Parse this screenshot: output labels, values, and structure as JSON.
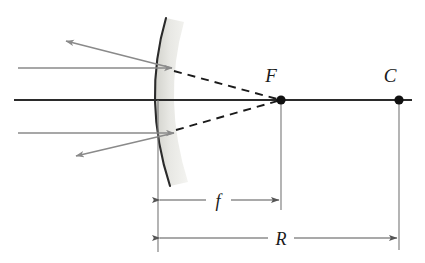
{
  "figure": {
    "type": "optics-ray-diagram",
    "background_color": "#ffffff"
  },
  "labels": {
    "focal_point": "F",
    "center_of_curvature": "C",
    "focal_length": "f",
    "radius_of_curvature": "R"
  },
  "colors": {
    "axis": "#2b2b2b",
    "ray": "#8a8a8a",
    "dashed_extension": "#1a1a1a",
    "mirror_outline": "#2b2b2b",
    "mirror_body": "#e4e4e0",
    "point_marker": "#111111",
    "dimension_line": "#555555",
    "tick_line": "#777777",
    "label_text": "#1a1a1a"
  },
  "geometry": {
    "mirror": {
      "vertex": [
        158,
        100
      ],
      "top": [
        166,
        18
      ],
      "bottom": [
        170,
        186
      ],
      "curvature": "convex-toward-left"
    },
    "principal_axis": {
      "start": [
        14,
        100
      ],
      "end": [
        412,
        100
      ]
    },
    "focal_point": [
      281,
      100
    ],
    "center_of_curvature": [
      399,
      100
    ],
    "incoming_rays": [
      {
        "name": "upper-incoming-ray",
        "from": [
          18,
          68
        ],
        "to": [
          172,
          68
        ]
      },
      {
        "name": "lower-incoming-ray",
        "from": [
          18,
          133
        ],
        "to": [
          174,
          133
        ]
      }
    ],
    "reflected_rays": [
      {
        "name": "upper-reflected-ray",
        "from": [
          172,
          68
        ],
        "to": [
          66,
          41
        ]
      },
      {
        "name": "lower-reflected-ray",
        "from": [
          174,
          133
        ],
        "to": [
          76,
          156
        ]
      }
    ],
    "dashed_extensions": [
      {
        "name": "upper-virtual-extension",
        "from": [
          174,
          71
        ],
        "to": [
          281,
          100
        ]
      },
      {
        "name": "lower-virtual-extension",
        "from": [
          176,
          130
        ],
        "to": [
          281,
          100
        ]
      }
    ],
    "dimensions": [
      {
        "name": "focal-length-dimension",
        "symbol": "f",
        "y": 200,
        "from_x": 158,
        "to_x": 281,
        "label_x": 218
      },
      {
        "name": "radius-dimension",
        "symbol": "R",
        "y": 238,
        "from_x": 158,
        "to_x": 399,
        "label_x": 281
      }
    ],
    "tick_lines": [
      {
        "name": "mirror-vertex-tick",
        "x": 158,
        "y1": 100,
        "y2": 252
      },
      {
        "name": "focal-point-tick",
        "x": 281,
        "y1": 100,
        "y2": 210
      },
      {
        "name": "center-point-tick",
        "x": 399,
        "y1": 100,
        "y2": 250
      }
    ],
    "label_positions": {
      "F": [
        271,
        82
      ],
      "C": [
        390,
        82
      ]
    }
  }
}
